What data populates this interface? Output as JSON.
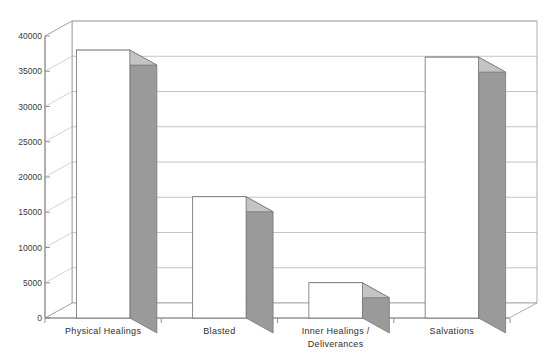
{
  "chart_data": {
    "type": "bar",
    "title": "",
    "subtitle": "",
    "xlabel": "",
    "ylabel": "",
    "categories": [
      "Physical Healings",
      "Blasted",
      "Inner Healings /\nDeliverances",
      "Salvations"
    ],
    "category_lines": [
      [
        "Physical Healings"
      ],
      [
        "Blasted"
      ],
      [
        "Inner Healings /",
        "Deliverances"
      ],
      [
        "Salvations"
      ]
    ],
    "values": [
      38000,
      17200,
      5000,
      37000
    ],
    "ylim": [
      0,
      40000
    ],
    "yticks": [
      0,
      5000,
      10000,
      15000,
      20000,
      25000,
      30000,
      35000,
      40000
    ],
    "ytick_labels": [
      "0",
      "5000",
      "10000",
      "15000",
      "20000",
      "25000",
      "30000",
      "35000",
      "40000"
    ],
    "grid": true,
    "grid_axis": "y",
    "legend": false,
    "style": "3d-column",
    "colors": {
      "bar_front": "#ffffff",
      "bar_side": "#9a9a9a",
      "bar_top": "#c4c4c4",
      "bar_outline": "#6e6e6e",
      "grid_line": "#aaaaaa",
      "axis_line": "#888888",
      "wall": "#ffffff",
      "floor": "#ffffff",
      "text": "#3a3a3a"
    }
  },
  "figure": {
    "title_text": "",
    "background": "#ffffff"
  }
}
